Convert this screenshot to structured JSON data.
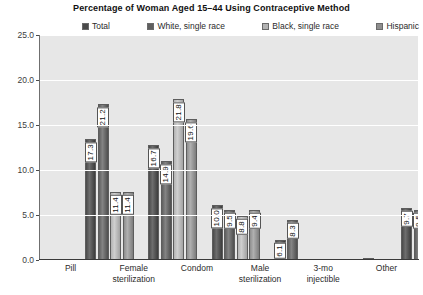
{
  "chart_data": {
    "type": "bar",
    "title": "Percentage of Woman Aged 15–44 Using Contraceptive Method",
    "xlabel": "",
    "ylabel": "",
    "ylim": [
      0,
      25
    ],
    "yticks": [
      "0.0",
      "5.0",
      "10.0",
      "15.0",
      "20.0",
      "25.0"
    ],
    "ytick_values": [
      0,
      5,
      10,
      15,
      20,
      25
    ],
    "grid": true,
    "legend_position": "top",
    "categories": [
      "Pill",
      "Female sterilization",
      "Condom",
      "Male sterilization",
      "3-mo injectible",
      "Other"
    ],
    "category_lines": [
      [
        "Pill"
      ],
      [
        "Female",
        "sterilization"
      ],
      [
        "Condom"
      ],
      [
        "Male",
        "sterilization"
      ],
      [
        "3-mo",
        "injectible"
      ],
      [
        "Other"
      ]
    ],
    "series": [
      {
        "name": "Total",
        "color": "#4a4a4a",
        "values": [
          17.3,
          16.7,
          10.0,
          6.1,
          2.0,
          9.7
        ]
      },
      {
        "name": "White, single race",
        "color": "#5f5f5f",
        "values": [
          21.2,
          14.9,
          9.5,
          8.3,
          1.4,
          9.5
        ]
      },
      {
        "name": "Black, single race",
        "color": "#b3b3b3",
        "values": [
          11.4,
          21.8,
          8.8,
          1.1,
          4.1,
          7.2
        ]
      },
      {
        "name": "Hispanic",
        "color": "#8e8e8e",
        "values": [
          11.4,
          19.6,
          9.4,
          3.4,
          2.6,
          11.6
        ]
      }
    ],
    "value_labels": [
      [
        "17.3",
        "21.2",
        "11.4",
        "11.4"
      ],
      [
        "16.7",
        "14.9",
        "21.8",
        "19.6"
      ],
      [
        "10.0",
        "9.5",
        "8.8",
        "9.4"
      ],
      [
        "6.1",
        "8.3",
        "1.1",
        "3.4"
      ],
      [
        "2.0",
        "1.4",
        "4.1",
        "2.6"
      ],
      [
        "9.7",
        "9.5",
        "7.2",
        "11.6"
      ]
    ],
    "plot_background": "#e7e7e7",
    "gridline_color": "#ffffff"
  }
}
